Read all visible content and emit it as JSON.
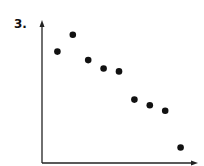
{
  "problem_label": "3.",
  "colors": {
    "axis": "#222222",
    "point": "#111111"
  },
  "chart_data": {
    "type": "scatter",
    "title": "",
    "xlabel": "",
    "ylabel": "",
    "xlim": [
      0,
      10
    ],
    "ylim": [
      0,
      10
    ],
    "grid": false,
    "legend": null,
    "x": [
      1,
      2,
      3,
      4,
      5,
      6,
      7,
      8,
      9
    ],
    "y": [
      7.9,
      9.1,
      7.3,
      6.7,
      6.5,
      4.5,
      4.1,
      3.7,
      1.1
    ],
    "annotations": [
      "Axes have arrows, no tick labels; negative correlation"
    ]
  }
}
